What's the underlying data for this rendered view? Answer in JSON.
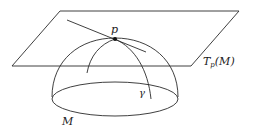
{
  "diagram": {
    "labels": {
      "point": "p",
      "plane": "T",
      "plane_sub": "p",
      "plane_arg": "(M)",
      "manifold": "M",
      "curve": "γ"
    },
    "colors": {
      "stroke": "#2a2a2a",
      "background": "#ffffff"
    }
  }
}
